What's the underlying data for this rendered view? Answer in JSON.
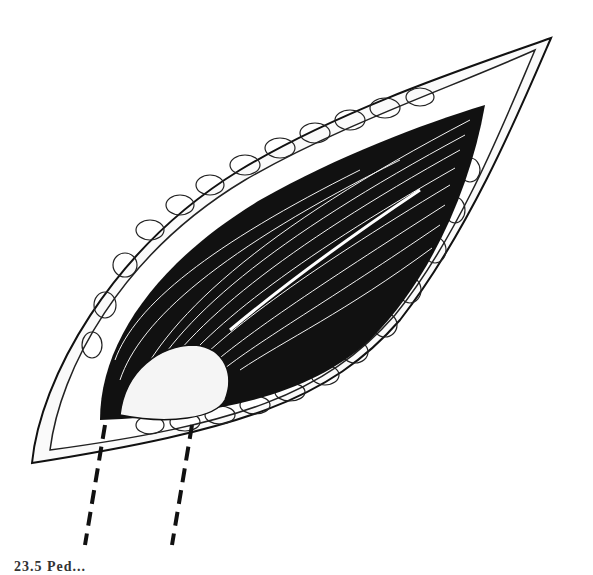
{
  "page": {
    "top_fragment_text": "dur",
    "bottom_caption_fragment": "23.5 Ped..."
  },
  "illustration": {
    "subject": "surgical-incision-illustration",
    "description": "Elliptical incision showing subcutaneous fat lobules around a dark muscle layer with a split fascia and an exposed rounded structure at lower left",
    "pointer_lines": 2,
    "colors": {
      "ink": "#111111",
      "paper": "#ffffff"
    }
  }
}
